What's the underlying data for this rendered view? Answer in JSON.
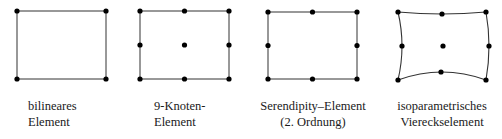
{
  "figure": {
    "elements": [
      {
        "id": "bilinear",
        "label_lines": [
          "bilineares",
          "Element"
        ],
        "node_count": 4,
        "edges": "straight"
      },
      {
        "id": "nine-node",
        "label_lines": [
          "9-Knoten-",
          "Element"
        ],
        "node_count": 9,
        "edges": "straight"
      },
      {
        "id": "serendipity",
        "label_lines": [
          "Serendipity–Element",
          "(2. Ordnung)"
        ],
        "node_count": 8,
        "edges": "straight"
      },
      {
        "id": "isoparametric",
        "label_lines": [
          "isoparametrisches",
          "Viereckselement"
        ],
        "node_count": 9,
        "edges": "curved"
      }
    ],
    "colors": {
      "line": "#333333",
      "node": "#000000",
      "text": "#1a1a1a",
      "background": "#ffffff"
    }
  }
}
